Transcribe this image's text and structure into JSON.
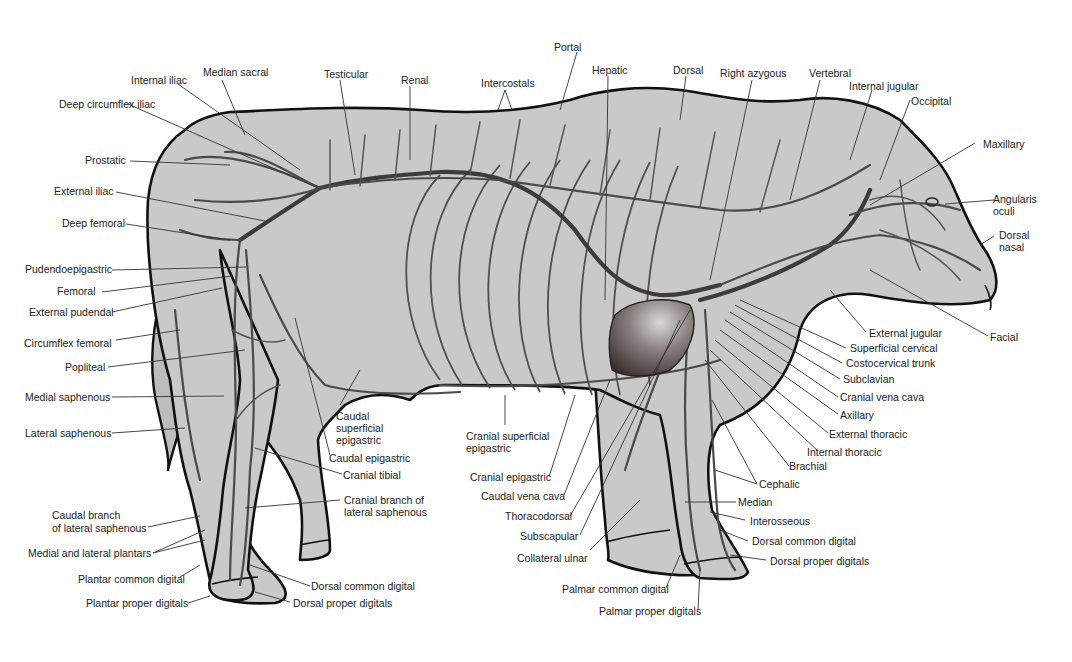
{
  "diagram": {
    "colors": {
      "body": "#c9c9c9",
      "outline": "#111111",
      "vein": "#4a4a4a",
      "heart": "#5a4a4a",
      "background": "#ffffff"
    },
    "labels": {
      "top": [
        {
          "id": "internal-iliac",
          "text": "Internal iliac"
        },
        {
          "id": "median-sacral",
          "text": "Median sacral"
        },
        {
          "id": "testicular",
          "text": "Testicular"
        },
        {
          "id": "renal",
          "text": "Renal"
        },
        {
          "id": "intercostals",
          "text": "Intercostals"
        },
        {
          "id": "portal",
          "text": "Portal"
        },
        {
          "id": "hepatic",
          "text": "Hepatic"
        },
        {
          "id": "dorsal",
          "text": "Dorsal"
        },
        {
          "id": "right-azygous",
          "text": "Right azygous"
        },
        {
          "id": "vertebral",
          "text": "Vertebral"
        },
        {
          "id": "internal-jugular",
          "text": "Internal jugular"
        },
        {
          "id": "occipital",
          "text": "Occipital"
        }
      ],
      "left": [
        {
          "id": "deep-circumflex-iliac",
          "text": "Deep circumflex iliac"
        },
        {
          "id": "prostatic",
          "text": "Prostatic"
        },
        {
          "id": "external-iliac",
          "text": "External iliac"
        },
        {
          "id": "deep-femoral",
          "text": "Deep femoral"
        },
        {
          "id": "pudendoepigastric",
          "text": "Pudendoepigastric"
        },
        {
          "id": "femoral",
          "text": "Femoral"
        },
        {
          "id": "external-pudendal",
          "text": "External pudendal"
        },
        {
          "id": "circumflex-femoral",
          "text": "Circumflex femoral"
        },
        {
          "id": "popliteal",
          "text": "Popliteal"
        },
        {
          "id": "medial-saphenous",
          "text": "Medial saphenous"
        },
        {
          "id": "lateral-saphenous",
          "text": "Lateral saphenous"
        },
        {
          "id": "caudal-branch-lateral-saphenous-1",
          "text": "Caudal branch"
        },
        {
          "id": "caudal-branch-lateral-saphenous-2",
          "text": "of lateral saphenous"
        },
        {
          "id": "medial-lateral-plantars",
          "text": "Medial and lateral plantars"
        },
        {
          "id": "plantar-common-digital",
          "text": "Plantar common digital"
        },
        {
          "id": "plantar-proper-digitals",
          "text": "Plantar proper digitals"
        }
      ],
      "middle": [
        {
          "id": "caudal-superficial-epigastric-1",
          "text": "Caudal"
        },
        {
          "id": "caudal-superficial-epigastric-2",
          "text": "superficial"
        },
        {
          "id": "caudal-superficial-epigastric-3",
          "text": "epigastric"
        },
        {
          "id": "caudal-epigastric",
          "text": "Caudal epigastric"
        },
        {
          "id": "cranial-tibial",
          "text": "Cranial tibial"
        },
        {
          "id": "cranial-branch-lateral-saphenous-1",
          "text": "Cranial branch of"
        },
        {
          "id": "cranial-branch-lateral-saphenous-2",
          "text": "lateral saphenous"
        },
        {
          "id": "dorsal-common-digital-hind",
          "text": "Dorsal common digital"
        },
        {
          "id": "dorsal-proper-digitals-hind",
          "text": "Dorsal proper digitals"
        },
        {
          "id": "cranial-superficial-epigastric-1",
          "text": "Cranial superficial"
        },
        {
          "id": "cranial-superficial-epigastric-2",
          "text": "epigastric"
        },
        {
          "id": "cranial-epigastric",
          "text": "Cranial epigastric"
        },
        {
          "id": "caudal-vena-cava",
          "text": "Caudal vena cava"
        },
        {
          "id": "thoracodorsal",
          "text": "Thoracodorsal"
        },
        {
          "id": "subscapular",
          "text": "Subscapular"
        },
        {
          "id": "collateral-ulnar",
          "text": "Collateral ulnar"
        },
        {
          "id": "palmar-common-digital",
          "text": "Palmar common digital"
        },
        {
          "id": "palmar-proper-digitals",
          "text": "Palmar proper digitals"
        }
      ],
      "right": [
        {
          "id": "maxillary",
          "text": "Maxillary"
        },
        {
          "id": "angularis-oculi-1",
          "text": "Angularis"
        },
        {
          "id": "angularis-oculi-2",
          "text": "oculi"
        },
        {
          "id": "dorsal-nasal-1",
          "text": "Dorsal"
        },
        {
          "id": "dorsal-nasal-2",
          "text": "nasal"
        },
        {
          "id": "facial",
          "text": "Facial"
        },
        {
          "id": "external-jugular",
          "text": "External jugular"
        },
        {
          "id": "superficial-cervical",
          "text": "Superficial cervical"
        },
        {
          "id": "costocervical-trunk",
          "text": "Costocervical trunk"
        },
        {
          "id": "subclavian",
          "text": "Subclavian"
        },
        {
          "id": "cranial-vena-cava",
          "text": "Cranial vena cava"
        },
        {
          "id": "axillary",
          "text": "Axillary"
        },
        {
          "id": "external-thoracic",
          "text": "External thoracic"
        },
        {
          "id": "internal-thoracic",
          "text": "Internal thoracic"
        },
        {
          "id": "brachial",
          "text": "Brachial"
        },
        {
          "id": "cephalic",
          "text": "Cephalic"
        },
        {
          "id": "median",
          "text": "Median"
        },
        {
          "id": "interosseous",
          "text": "Interosseous"
        },
        {
          "id": "dorsal-common-digital-fore",
          "text": "Dorsal common digital"
        },
        {
          "id": "dorsal-proper-digitals-fore",
          "text": "Dorsal proper digitals"
        }
      ]
    }
  }
}
